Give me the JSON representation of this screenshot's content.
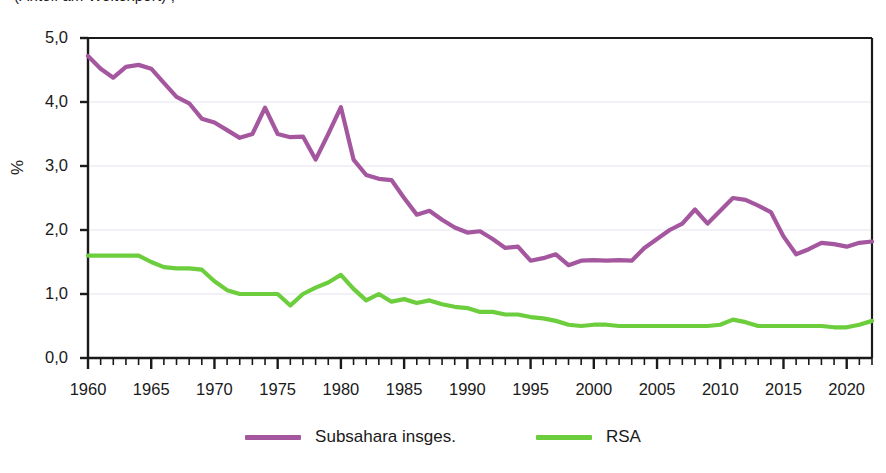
{
  "title_cropped": "(Anteil am Weltexport) ,",
  "chart_data": {
    "type": "line",
    "title": "",
    "xlabel": "",
    "ylabel": "%",
    "xlim": [
      1960,
      2022
    ],
    "ylim": [
      0.0,
      5.0
    ],
    "ytick_labels": [
      "0,0",
      "1,0",
      "2,0",
      "3,0",
      "4,0",
      "5,0"
    ],
    "ytick_values": [
      0.0,
      1.0,
      2.0,
      3.0,
      4.0,
      5.0
    ],
    "xtick_labels": [
      "1960",
      "1965",
      "1970",
      "1975",
      "1980",
      "1985",
      "1990",
      "1995",
      "2000",
      "2005",
      "2010",
      "2015",
      "2020"
    ],
    "xtick_values": [
      1960,
      1965,
      1970,
      1975,
      1980,
      1985,
      1990,
      1995,
      2000,
      2005,
      2010,
      2015,
      2020
    ],
    "minor_xtick_step": 1,
    "grid": "horizontal-only",
    "legend_position": "bottom-center",
    "x": [
      1960,
      1961,
      1962,
      1963,
      1964,
      1965,
      1966,
      1967,
      1968,
      1969,
      1970,
      1971,
      1972,
      1973,
      1974,
      1975,
      1976,
      1977,
      1978,
      1979,
      1980,
      1981,
      1982,
      1983,
      1984,
      1985,
      1986,
      1987,
      1988,
      1989,
      1990,
      1991,
      1992,
      1993,
      1994,
      1995,
      1996,
      1997,
      1998,
      1999,
      2000,
      2001,
      2002,
      2003,
      2004,
      2005,
      2006,
      2007,
      2008,
      2009,
      2010,
      2011,
      2012,
      2013,
      2014,
      2015,
      2016,
      2017,
      2018,
      2019,
      2020,
      2021,
      2022
    ],
    "series": [
      {
        "name": "Subsahara insges.",
        "color": "#a4579e",
        "values": [
          4.72,
          4.52,
          4.38,
          4.55,
          4.58,
          4.52,
          4.3,
          4.08,
          3.98,
          3.74,
          3.68,
          3.56,
          3.44,
          3.5,
          3.91,
          3.5,
          3.45,
          3.46,
          3.1,
          3.5,
          3.92,
          3.1,
          2.86,
          2.8,
          2.78,
          2.5,
          2.24,
          2.3,
          2.16,
          2.04,
          1.96,
          1.98,
          1.86,
          1.72,
          1.74,
          1.52,
          1.56,
          1.62,
          1.45,
          1.52,
          1.53,
          1.52,
          1.53,
          1.52,
          1.72,
          1.86,
          2.0,
          2.1,
          2.32,
          2.1,
          2.3,
          2.5,
          2.47,
          2.38,
          2.28,
          1.9,
          1.62,
          1.7,
          1.8,
          1.78,
          1.74,
          1.8,
          1.82
        ]
      },
      {
        "name": "RSA",
        "color": "#6cce3c",
        "values": [
          1.6,
          1.6,
          1.6,
          1.6,
          1.6,
          1.5,
          1.42,
          1.4,
          1.4,
          1.38,
          1.2,
          1.06,
          1.0,
          1.0,
          1.0,
          1.0,
          0.82,
          1.0,
          1.1,
          1.18,
          1.3,
          1.08,
          0.9,
          1.0,
          0.88,
          0.92,
          0.86,
          0.9,
          0.84,
          0.8,
          0.78,
          0.72,
          0.72,
          0.68,
          0.68,
          0.64,
          0.62,
          0.58,
          0.52,
          0.5,
          0.52,
          0.52,
          0.5,
          0.5,
          0.5,
          0.5,
          0.5,
          0.5,
          0.5,
          0.5,
          0.52,
          0.6,
          0.56,
          0.5,
          0.5,
          0.5,
          0.5,
          0.5,
          0.5,
          0.48,
          0.48,
          0.52,
          0.58
        ]
      }
    ]
  },
  "legend": {
    "items": [
      {
        "label": "Subsahara insges.",
        "color": "#a4579e"
      },
      {
        "label": "RSA",
        "color": "#6cce3c"
      }
    ]
  },
  "colors": {
    "subsahara": "#a4579e",
    "rsa": "#6cce3c",
    "axis": "#1a1a1a",
    "grid": "#e3e3ef",
    "background": "#ffffff"
  }
}
